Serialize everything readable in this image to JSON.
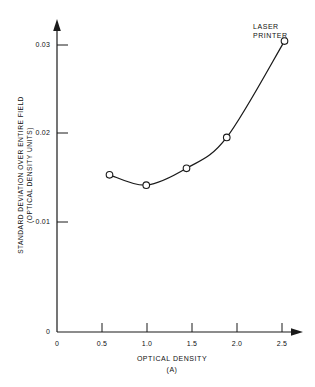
{
  "chart_data": {
    "type": "line",
    "title": "",
    "subtitle": "",
    "xlabel": "OPTICAL DENSITY",
    "xlabel_sub": "(A)",
    "ylabel_line1": "STANDARD DEVIATION OVER ENTIRE FIELD",
    "ylabel_line2": "(OPTICAL DENSITY UNITS)",
    "xlim": [
      0,
      2.72
    ],
    "ylim": [
      0,
      0.0325
    ],
    "grid": false,
    "legend_position": "none",
    "x_ticks": [
      {
        "value": 0,
        "label": "0"
      },
      {
        "value": 0.5,
        "label": "0.5"
      },
      {
        "value": 1.0,
        "label": "1.0"
      },
      {
        "value": 1.5,
        "label": "1.5"
      },
      {
        "value": 2.0,
        "label": "2.0"
      },
      {
        "value": 2.5,
        "label": "2.5"
      }
    ],
    "y_ticks": [
      {
        "value": 0,
        "label": "0"
      },
      {
        "value": 0.01,
        "label": "0.01"
      },
      {
        "value": 0.02,
        "label": "0.02"
      },
      {
        "value": 0.03,
        "label": "0.03"
      }
    ],
    "series": [
      {
        "name": "LASER PRINTER",
        "marker": "open-circle",
        "color": "#1a1a1a",
        "x": [
          0.6,
          1.02,
          1.48,
          1.94,
          2.6
        ],
        "y": [
          0.0168,
          0.0157,
          0.0175,
          0.0208,
          0.0311
        ]
      }
    ],
    "annotations": [
      {
        "text_line1": "LASER",
        "text_line2": "PRINTER",
        "x": 2.6,
        "y": 0.0311
      }
    ]
  },
  "axis_color": "#1a1a1a",
  "background": "#ffffff"
}
